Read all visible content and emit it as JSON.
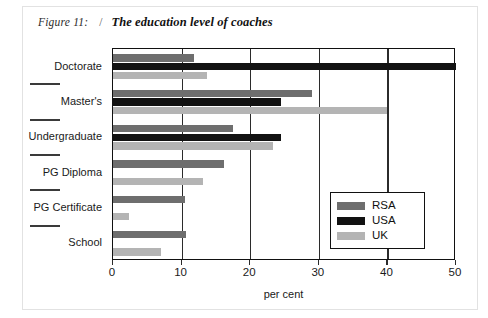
{
  "caption": {
    "figure_label": "Figure 11:",
    "separator": "/",
    "title": "The education level of coaches"
  },
  "chart_data": {
    "type": "bar",
    "orientation": "horizontal",
    "title": "The education level of coaches",
    "xlabel": "per cent",
    "ylabel": "",
    "xlim": [
      0,
      50
    ],
    "xticks": [
      0,
      10,
      20,
      30,
      40,
      50
    ],
    "xticklabels": [
      "0",
      "10",
      "20",
      "30",
      "40",
      "50"
    ],
    "grid": true,
    "legend_position": "lower right",
    "categories": [
      "Doctorate",
      "Master's",
      "Undergraduate",
      "PG Diploma",
      "PG Certificate",
      "School"
    ],
    "series": [
      {
        "name": "RSA",
        "color": "#6e6e6e",
        "values": [
          11.8,
          29.0,
          17.5,
          16.2,
          10.5,
          10.6
        ]
      },
      {
        "name": "USA",
        "color": "#121212",
        "values": [
          50.0,
          24.5,
          24.5,
          0,
          0,
          0
        ]
      },
      {
        "name": "UK",
        "color": "#b4b4b4",
        "values": [
          13.7,
          40.0,
          23.3,
          13.1,
          2.3,
          7.0
        ]
      }
    ]
  },
  "legend": {
    "items": [
      {
        "label": "RSA",
        "color": "#6e6e6e"
      },
      {
        "label": "USA",
        "color": "#121212"
      },
      {
        "label": "UK",
        "color": "#b4b4b4"
      }
    ]
  }
}
